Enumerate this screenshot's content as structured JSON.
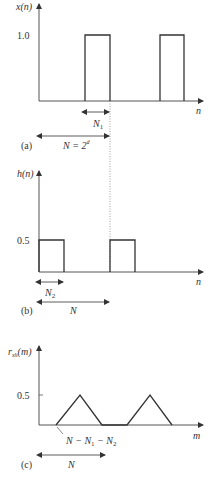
{
  "panel_a": {
    "ylabel": "x(n)",
    "xlabel": "n",
    "ytick": "1.0",
    "label": "(a)",
    "span_N1": "N",
    "span_N1_sub": "1",
    "span_N": "N = 2",
    "span_N_sup": "d"
  },
  "panel_b": {
    "ylabel": "h(n)",
    "xlabel": "n",
    "ytick": "0.5",
    "label": "(b)",
    "span_N2": "N",
    "span_N2_sub": "2",
    "span_N": "N"
  },
  "panel_c": {
    "ylabel": "r",
    "ylabel_sub": "xh",
    "ylabel_arg": "(m)",
    "xlabel": "m",
    "ytick": "0.5",
    "label": "(c)",
    "annotation": "N − N",
    "annotation_sub1": "1",
    "annotation_mid": " − N",
    "annotation_sub2": "2",
    "span_N": "N"
  }
}
